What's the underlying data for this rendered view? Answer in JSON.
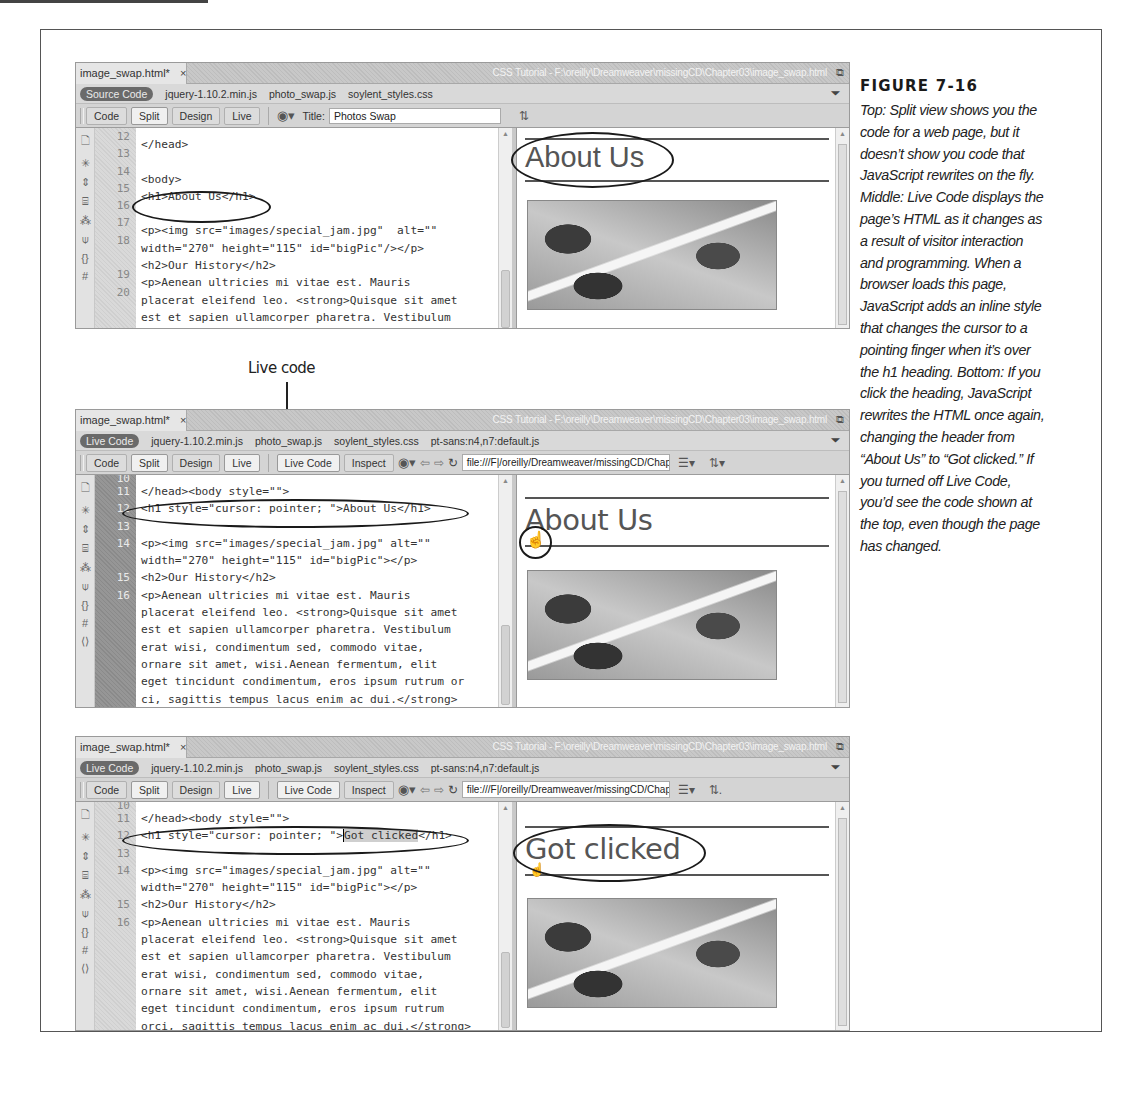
{
  "figure": {
    "label": "FIGURE 7-16",
    "caption": "Top: Split view shows you the code for a web page, but it doesn’t show you code that JavaScript rewrites on the fly. Middle: Live Code displays the page’s HTML as it changes as a result of visitor interaction and programming. When a browser loads this page, JavaScript adds an inline style that changes the cursor to a pointing finger when it’s over the h1 heading. Bottom: If you click the heading, JavaScript rewrites the HTML once again, changing the header from “About Us” to “Got clicked.” If you turned off Live Code, you’d see the code shown at the top, even though the page has changed.",
    "callout": "Live code"
  },
  "screens": [
    {
      "doc_tab": "image_swap.html*",
      "close_glyph": "×",
      "window_path": "CSS Tutorial - F:\\oreilly\\Dreamweaver\\missingCD\\Chapter03\\image_swap.html",
      "mode_pill": "Source Code",
      "related_files": [
        "jquery-1.10.2.min.js",
        "photo_swap.js",
        "soylent_styles.css"
      ],
      "view_buttons": [
        "Code",
        "Split",
        "Design",
        "Live"
      ],
      "title_label": "Title:",
      "title_value": "Photos Swap",
      "line_numbers": [
        "12",
        "13",
        "14",
        "15",
        "16",
        "17",
        "18",
        "",
        "19",
        "20",
        "",
        ""
      ],
      "code_lines": [
        "",
        "</head>",
        "",
        "<body>",
        "<h1>About Us</h1>",
        "",
        "<p><img src=\"images/special_jam.jpg\"  alt=\"\"",
        "width=\"270\" height=\"115\" id=\"bigPic\"/></p>",
        "<h2>Our History</h2>",
        "<p>Aenean ultricies mi vitae est. Mauris",
        "placerat eleifend leo. <strong>Quisque sit amet",
        "est et sapien ullamcorper pharetra. Vestibulum"
      ],
      "heading": "About Us"
    },
    {
      "doc_tab": "image_swap.html*",
      "close_glyph": "×",
      "window_path": "CSS Tutorial - F:\\oreilly\\Dreamweaver\\missingCD\\Chapter03\\image_swap.html",
      "mode_pill": "Live Code",
      "related_files": [
        "jquery-1.10.2.min.js",
        "photo_swap.js",
        "soylent_styles.css",
        "pt-sans:n4,n7:default.js"
      ],
      "view_buttons": [
        "Code",
        "Split",
        "Design",
        "Live"
      ],
      "live_buttons": [
        "Live Code",
        "Inspect"
      ],
      "url_value": "file:///F|/oreilly/Dreamweaver/missingCD/Chap",
      "line_numbers": [
        "10",
        "11",
        "12",
        "13",
        "14",
        "",
        "15",
        "16",
        "",
        "",
        "",
        "",
        "",
        ""
      ],
      "code_lines": [
        "",
        "</head><body style=\"\">",
        "<h1 style=\"cursor: pointer; \">About Us</h1>",
        "",
        "<p><img src=\"images/special_jam.jpg\" alt=\"\"",
        "width=\"270\" height=\"115\" id=\"bigPic\"></p>",
        "<h2>Our History</h2>",
        "<p>Aenean ultricies mi vitae est. Mauris",
        "placerat eleifend leo. <strong>Quisque sit amet",
        "est et sapien ullamcorper pharetra. Vestibulum",
        "erat wisi, condimentum sed, commodo vitae,",
        "ornare sit amet, wisi.Aenean fermentum, elit",
        "eget tincidunt condimentum, eros ipsum rutrum or",
        "ci, sagittis tempus lacus enim ac dui.</strong>"
      ],
      "heading": "About Us"
    },
    {
      "doc_tab": "image_swap.html*",
      "close_glyph": "×",
      "window_path": "CSS Tutorial - F:\\oreilly\\Dreamweaver\\missingCD\\Chapter03\\image_swap.html",
      "mode_pill": "Live Code",
      "related_files": [
        "jquery-1.10.2.min.js",
        "photo_swap.js",
        "soylent_styles.css",
        "pt-sans:n4,n7:default.js"
      ],
      "view_buttons": [
        "Code",
        "Split",
        "Design",
        "Live"
      ],
      "live_buttons": [
        "Live Code",
        "Inspect"
      ],
      "url_value": "file:///F|/oreilly/Dreamweaver/missingCD/Chap",
      "line_numbers": [
        "10",
        "11",
        "12",
        "13",
        "14",
        "",
        "15",
        "16",
        "",
        "",
        "",
        "",
        "",
        ""
      ],
      "code_lines": [
        "",
        "</head><body style=\"\">",
        "<h1 style=\"cursor: pointer; \">",
        "",
        "<p><img src=\"images/special_jam.jpg\" alt=\"\"",
        "width=\"270\" height=\"115\" id=\"bigPic\"></p>",
        "<h2>Our History</h2>",
        "<p>Aenean ultricies mi vitae est. Mauris",
        "placerat eleifend leo. <strong>Quisque sit amet",
        "est et sapien ullamcorper pharetra. Vestibulum",
        "erat wisi, condimentum sed, commodo vitae,",
        "ornare sit amet, wisi.Aenean fermentum, elit",
        "eget tincidunt condimentum, eros ipsum rutrum",
        "orci, sagittis tempus lacus enim ac dui.</strong>"
      ],
      "selected_text": "Got clicked",
      "after_selection": "</h1>",
      "heading": "Got clicked"
    }
  ],
  "icons": {
    "filter": "filter-icon",
    "globe": "browser-preview-icon",
    "refresh": "refresh-icon",
    "back": "back-arrow-icon",
    "forward": "forward-arrow-icon",
    "restore": "window-restore-icon",
    "file_mgmt": "file-management-icon"
  }
}
